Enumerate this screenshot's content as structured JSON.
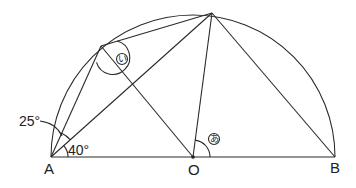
{
  "diagram": {
    "type": "geometry",
    "points": {
      "A": {
        "label": "A",
        "x": 51,
        "y": 157
      },
      "O": {
        "label": "O",
        "x": 193,
        "y": 157
      },
      "B": {
        "label": "B",
        "x": 335,
        "y": 157
      },
      "C": {
        "label": "",
        "x": 101,
        "y": 46
      },
      "D": {
        "label": "",
        "x": 212,
        "y": 13
      }
    },
    "angles": {
      "angle_25": {
        "label": "25°"
      },
      "angle_40": {
        "label": "40°"
      },
      "angle_a": {
        "label": "あ"
      },
      "angle_i": {
        "label": "い"
      }
    },
    "segments": [
      "AB",
      "AC",
      "AD",
      "CD",
      "CO",
      "OD",
      "DB"
    ]
  }
}
